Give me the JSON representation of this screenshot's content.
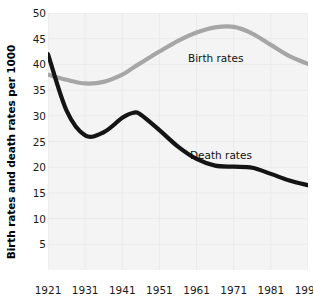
{
  "chart_data": {
    "type": "line",
    "title": "",
    "subtitle": "",
    "xlabel": "",
    "ylabel": "Birth rates and death rates per 1000",
    "xlim": [
      1921,
      1991
    ],
    "ylim": [
      0,
      50
    ],
    "yticks": [
      5,
      10,
      15,
      20,
      25,
      30,
      35,
      40,
      45,
      50
    ],
    "ytick_labels": [
      "5",
      "10",
      "15",
      "20",
      "25",
      "30",
      "35",
      "40",
      "45",
      "50"
    ],
    "xticks": [
      1921,
      1931,
      1941,
      1951,
      1961,
      1971,
      1981,
      1991
    ],
    "xtick_labels": [
      "1921",
      "1931",
      "1941",
      "1951",
      "1961",
      "1971",
      "1981",
      "1991"
    ],
    "grid": true,
    "legend_position": "inline-annotations",
    "plot_background": "#f4f4f4",
    "x": [
      1921,
      1926,
      1931,
      1936,
      1941,
      1944,
      1946,
      1951,
      1956,
      1961,
      1966,
      1971,
      1976,
      1981,
      1986,
      1991
    ],
    "series": [
      {
        "name": "Birth rates",
        "color": "#a6a6a6",
        "label_text": "Birth rates",
        "values": [
          38.0,
          37.0,
          36.3,
          36.6,
          38.0,
          39.4,
          40.3,
          42.5,
          44.6,
          46.2,
          47.2,
          47.3,
          46.0,
          43.8,
          41.6,
          40.1
        ]
      },
      {
        "name": "Death rates",
        "color": "#141414",
        "label_text": "Death rates",
        "values": [
          42.0,
          31.0,
          26.2,
          26.8,
          29.6,
          30.6,
          30.2,
          27.2,
          24.0,
          21.6,
          20.3,
          20.1,
          19.9,
          18.7,
          17.4,
          16.5
        ]
      }
    ]
  }
}
